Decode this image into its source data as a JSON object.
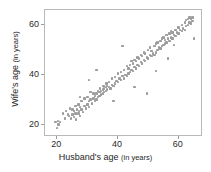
{
  "chart_data": {
    "type": "scatter",
    "title": "",
    "xlabel": "Husband's age (in years)",
    "ylabel": "Wife's age (in years)",
    "xlabel_main": "Husband's age",
    "xlabel_unit": "(in years)",
    "ylabel_main": "Wife's age",
    "ylabel_unit": "(in years)",
    "xlim": [
      16,
      68
    ],
    "ylim": [
      15,
      66
    ],
    "xticks": [
      20,
      40,
      60
    ],
    "yticks": [
      20,
      40,
      60
    ],
    "xticklabels": [
      "20",
      "40",
      "60"
    ],
    "yticklabels": [
      "20",
      "60",
      "40"
    ],
    "grid": false,
    "legend": null,
    "marker_color": "#9d9d9d",
    "frame_color": "#b9b9b9",
    "n_points": 170,
    "series": [
      {
        "name": "couples",
        "x": [
          19.5,
          20.0,
          20.2,
          20.5,
          21.0,
          22.0,
          22.5,
          23.0,
          23.5,
          24.0,
          24.2,
          24.5,
          25.0,
          25.0,
          25.5,
          25.5,
          26.0,
          26.0,
          26.2,
          26.5,
          27.0,
          27.0,
          27.2,
          27.5,
          27.5,
          28.0,
          28.0,
          28.5,
          29.0,
          29.0,
          29.5,
          30.0,
          30.0,
          30.5,
          30.5,
          31.0,
          31.0,
          31.5,
          32.0,
          32.0,
          32.5,
          32.5,
          33.0,
          33.0,
          33.5,
          33.5,
          34.0,
          34.0,
          34.2,
          34.5,
          34.5,
          35.0,
          35.0,
          35.2,
          35.5,
          35.5,
          36.0,
          36.0,
          36.2,
          36.5,
          36.5,
          37.0,
          37.0,
          37.5,
          38.0,
          38.0,
          38.5,
          39.0,
          39.0,
          39.5,
          40.0,
          40.0,
          40.5,
          41.0,
          41.0,
          41.5,
          42.0,
          42.0,
          42.5,
          43.0,
          43.0,
          43.5,
          43.5,
          44.0,
          44.0,
          44.5,
          44.5,
          45.0,
          45.0,
          45.5,
          45.5,
          46.0,
          46.0,
          46.5,
          46.5,
          47.0,
          47.0,
          47.5,
          47.5,
          48.0,
          48.0,
          48.5,
          48.5,
          49.0,
          49.0,
          49.5,
          50.0,
          50.0,
          50.5,
          50.5,
          51.0,
          51.0,
          51.5,
          52.0,
          52.0,
          52.5,
          52.5,
          53.0,
          53.0,
          53.5,
          54.0,
          54.0,
          54.5,
          54.5,
          55.0,
          55.0,
          55.5,
          55.5,
          56.0,
          56.0,
          56.5,
          57.0,
          57.0,
          57.5,
          57.5,
          58.0,
          58.0,
          58.5,
          59.0,
          59.0,
          59.5,
          60.0,
          60.0,
          60.5,
          61.0,
          61.0,
          61.5,
          62.0,
          62.0,
          62.5,
          62.5,
          63.0,
          63.0,
          63.5,
          63.5,
          64.0,
          64.0,
          64.5,
          64.5,
          65.0,
          33.0,
          41.5,
          49.5,
          52.5,
          56.5,
          58.5,
          45.5,
          38.5,
          30.5,
          27.5
        ],
        "y": [
          21.0,
          18.5,
          21.5,
          20.0,
          21.0,
          24.5,
          22.5,
          25.5,
          24.0,
          23.5,
          26.5,
          22.5,
          24.0,
          26.0,
          23.0,
          25.5,
          24.5,
          27.5,
          22.0,
          26.0,
          24.5,
          28.0,
          25.5,
          23.5,
          27.0,
          26.0,
          29.5,
          25.0,
          27.5,
          30.5,
          26.5,
          28.0,
          31.0,
          27.0,
          29.5,
          30.0,
          33.0,
          28.5,
          30.5,
          32.5,
          29.5,
          31.5,
          30.0,
          32.5,
          31.0,
          33.5,
          31.5,
          33.0,
          34.5,
          32.0,
          33.5,
          32.5,
          34.0,
          35.5,
          33.0,
          34.5,
          33.5,
          35.0,
          36.5,
          34.0,
          35.5,
          35.0,
          37.0,
          34.5,
          36.0,
          38.5,
          35.5,
          36.5,
          39.0,
          37.5,
          37.0,
          40.5,
          38.5,
          38.0,
          41.0,
          39.5,
          38.5,
          42.0,
          40.0,
          39.5,
          43.5,
          40.5,
          42.5,
          41.0,
          44.0,
          42.0,
          45.5,
          41.5,
          44.5,
          43.0,
          46.0,
          42.5,
          45.5,
          44.0,
          47.0,
          43.5,
          46.5,
          45.0,
          48.0,
          44.5,
          47.5,
          46.0,
          49.0,
          45.5,
          48.5,
          47.0,
          46.5,
          50.0,
          48.0,
          51.0,
          47.5,
          49.5,
          48.5,
          48.0,
          51.5,
          49.0,
          52.5,
          50.0,
          53.0,
          51.0,
          50.5,
          53.5,
          51.5,
          54.5,
          52.0,
          55.0,
          52.5,
          54.0,
          53.0,
          56.0,
          54.5,
          53.5,
          56.5,
          55.0,
          57.5,
          54.5,
          57.0,
          56.0,
          55.5,
          58.0,
          57.0,
          56.5,
          59.0,
          58.0,
          57.5,
          60.0,
          58.5,
          58.0,
          61.0,
          59.5,
          62.0,
          60.0,
          62.5,
          61.0,
          63.0,
          60.5,
          62.5,
          61.5,
          63.0,
          54.5,
          42.0,
          51.5,
          32.5,
          41.5,
          46.5,
          52.0,
          35.0,
          29.5,
          38.0,
          31.0
        ]
      }
    ]
  }
}
